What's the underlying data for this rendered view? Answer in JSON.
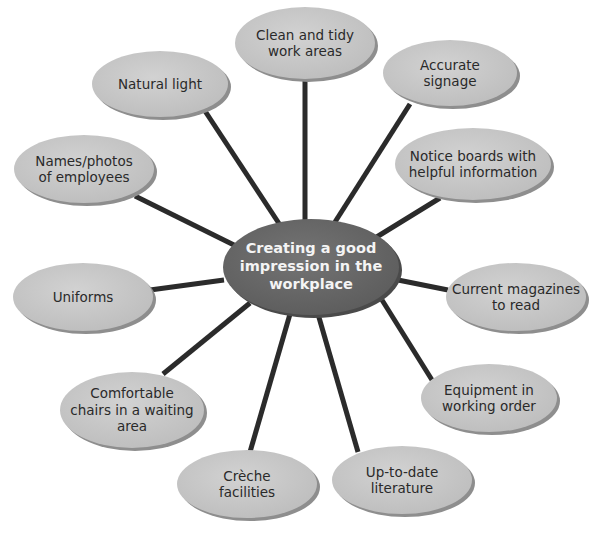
{
  "diagram": {
    "type": "spider-diagram",
    "center": {
      "label": "Creating a good\nimpression in the\nworkplace",
      "cx": 311,
      "cy": 267,
      "rx": 88,
      "ry": 48
    },
    "nodes": [
      {
        "id": "clean-tidy",
        "label": "Clean and tidy\nwork areas",
        "cx": 305,
        "cy": 43,
        "rx": 70,
        "ry": 36
      },
      {
        "id": "accurate-signage",
        "label": "Accurate\nsignage",
        "cx": 450,
        "cy": 73,
        "rx": 67,
        "ry": 33
      },
      {
        "id": "natural-light",
        "label": "Natural light",
        "cx": 160,
        "cy": 84,
        "rx": 68,
        "ry": 33
      },
      {
        "id": "notice-boards",
        "label": "Notice boards with\nhelpful information",
        "cx": 473,
        "cy": 164,
        "rx": 78,
        "ry": 36
      },
      {
        "id": "names-photos",
        "label": "Names/photos\nof employees",
        "cx": 84,
        "cy": 169,
        "rx": 70,
        "ry": 34
      },
      {
        "id": "uniforms",
        "label": "Uniforms",
        "cx": 83,
        "cy": 297,
        "rx": 70,
        "ry": 34
      },
      {
        "id": "current-magazines",
        "label": "Current magazines\nto read",
        "cx": 516,
        "cy": 297,
        "rx": 70,
        "ry": 34
      },
      {
        "id": "comfortable-chairs",
        "label": "Comfortable\nchairs in a waiting\narea",
        "cx": 132,
        "cy": 410,
        "rx": 72,
        "ry": 38
      },
      {
        "id": "equipment",
        "label": "Equipment in\nworking order",
        "cx": 489,
        "cy": 398,
        "rx": 68,
        "ry": 34
      },
      {
        "id": "creche",
        "label": "Crèche\nfacilities",
        "cx": 247,
        "cy": 484,
        "rx": 70,
        "ry": 34
      },
      {
        "id": "up-to-date-literature",
        "label": "Up-to-date\nliterature",
        "cx": 402,
        "cy": 480,
        "rx": 70,
        "ry": 34
      }
    ],
    "connectors": [
      {
        "to": "clean-tidy",
        "x1": 305,
        "y1": 225,
        "x2": 305,
        "y2": 78
      },
      {
        "to": "accurate-signage",
        "x1": 335,
        "y1": 222,
        "x2": 410,
        "y2": 104
      },
      {
        "to": "natural-light",
        "x1": 280,
        "y1": 225,
        "x2": 205,
        "y2": 111
      },
      {
        "to": "notice-boards",
        "x1": 375,
        "y1": 238,
        "x2": 440,
        "y2": 198
      },
      {
        "to": "names-photos",
        "x1": 240,
        "y1": 248,
        "x2": 135,
        "y2": 196
      },
      {
        "to": "uniforms",
        "x1": 224,
        "y1": 280,
        "x2": 150,
        "y2": 290
      },
      {
        "to": "current-magazines",
        "x1": 398,
        "y1": 280,
        "x2": 448,
        "y2": 290
      },
      {
        "to": "comfortable-chairs",
        "x1": 250,
        "y1": 303,
        "x2": 163,
        "y2": 374
      },
      {
        "to": "equipment",
        "x1": 382,
        "y1": 300,
        "x2": 432,
        "y2": 380
      },
      {
        "to": "creche",
        "x1": 290,
        "y1": 314,
        "x2": 250,
        "y2": 452
      },
      {
        "to": "up-to-date-literature",
        "x1": 318,
        "y1": 314,
        "x2": 358,
        "y2": 452
      }
    ]
  },
  "colors": {
    "background": "#ffffff",
    "node_fill": "#c9c9c9",
    "node_shadow": "#8e8e8e",
    "center_fill": "#6a6a6a",
    "center_shadow": "#4a4a4a",
    "connector": "#2b2b2b",
    "node_text": "#2a2a2a",
    "center_text": "#f4f4f4"
  }
}
